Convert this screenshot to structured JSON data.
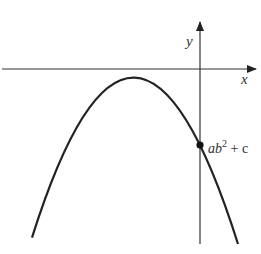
{
  "diagram": {
    "type": "graph-of-function",
    "axes": {
      "x_label": "x",
      "y_label": "y"
    },
    "curve": {
      "kind": "parabola",
      "opens": "down",
      "vertex_quadrant": "III (left of y-axis, below x-axis)"
    },
    "point": {
      "label_main": "ab",
      "label_sup": "2",
      "label_tail": " + c",
      "location": "y-intercept"
    },
    "colors": {
      "stroke": "#222222",
      "background": "#ffffff"
    }
  }
}
